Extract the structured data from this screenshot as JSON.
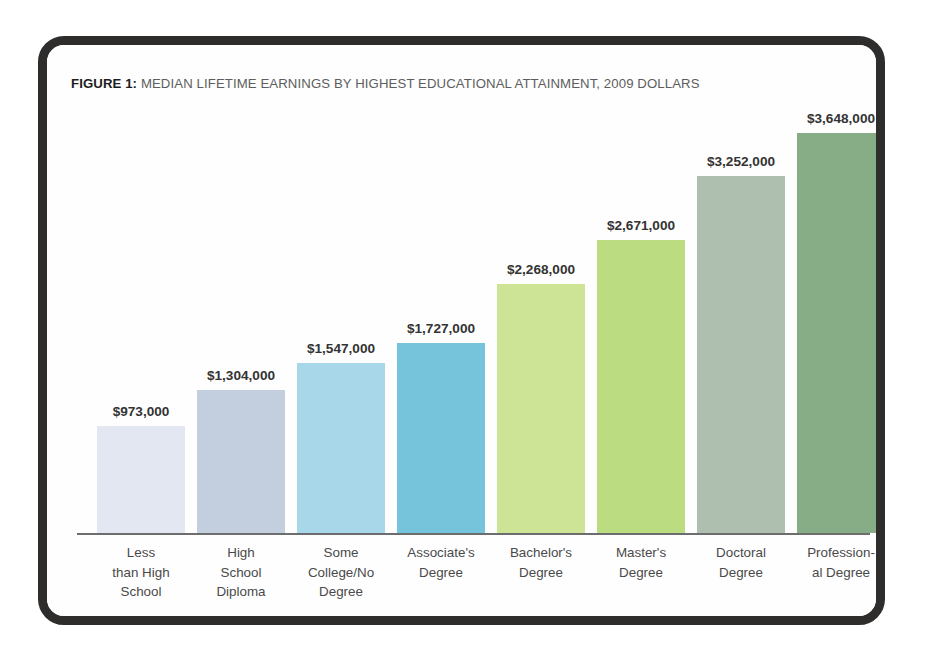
{
  "figure": {
    "label": "FIGURE 1:",
    "title": " MEDIAN LIFETIME EARNINGS BY HIGHEST EDUCATIONAL ATTAINMENT, 2009 DOLLARS"
  },
  "chart_data": {
    "type": "bar",
    "title": "FIGURE 1: MEDIAN LIFETIME EARNINGS BY HIGHEST EDUCATIONAL ATTAINMENT, 2009 DOLLARS",
    "xlabel": "",
    "ylabel": "",
    "ylim": [
      0,
      3900000
    ],
    "grid": false,
    "legend": "none",
    "categories": [
      "Less than High School",
      "High School Diploma",
      "Some College/No Degree",
      "Associate's Degree",
      "Bachelor's Degree",
      "Master's Degree",
      "Doctoral Degree",
      "Professional Degree"
    ],
    "category_lines": [
      [
        "Less",
        "than High",
        "School"
      ],
      [
        "High",
        "School",
        "Diploma"
      ],
      [
        "Some",
        "College/No",
        "Degree"
      ],
      [
        "Associate's",
        "Degree"
      ],
      [
        "Bachelor's",
        "Degree"
      ],
      [
        "Master's",
        "Degree"
      ],
      [
        "Doctoral",
        "Degree"
      ],
      [
        "Profession-",
        "al Degree"
      ]
    ],
    "values": [
      973000,
      1304000,
      1547000,
      1727000,
      2268000,
      2671000,
      3252000,
      3648000
    ],
    "value_labels": [
      "$973,000",
      "$1,304,000",
      "$1,547,000",
      "$1,727,000",
      "$2,268,000",
      "$2,671,000",
      "$3,252,000",
      "$3,648,000"
    ],
    "bar_colors": [
      "#e3e7f1",
      "#c3cedf",
      "#a7d7e8",
      "#76c3dc",
      "#cde396",
      "#bcdc82",
      "#aebfb0",
      "#87ad87"
    ]
  },
  "style": {
    "frame_border_color": "#2e2d2c",
    "axis_color": "#6d6d6d",
    "label_text_color": "#4a4a4a",
    "value_text_color": "#333333",
    "page_background": "#ffffff"
  }
}
